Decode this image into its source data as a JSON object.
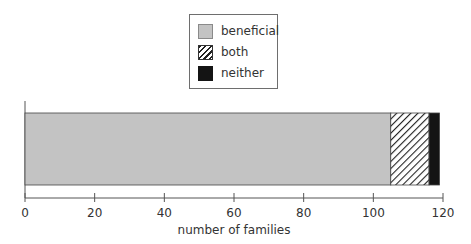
{
  "chart_data": {
    "type": "bar",
    "orientation": "horizontal",
    "stacked": true,
    "categories": [
      ""
    ],
    "series": [
      {
        "name": "beneficial",
        "values": [
          105
        ],
        "color": "#c3c3c3",
        "pattern": "solid"
      },
      {
        "name": "both",
        "values": [
          11
        ],
        "color": "#ffffff",
        "pattern": "diagonal-hatch"
      },
      {
        "name": "neither",
        "values": [
          3
        ],
        "color": "#141414",
        "pattern": "solid"
      }
    ],
    "title": "",
    "xlabel": "number of families",
    "ylabel": "",
    "xlim": [
      0,
      120
    ],
    "xticks": [
      0,
      20,
      40,
      60,
      80,
      100,
      120
    ],
    "grid": false,
    "legend_position": "top-center"
  },
  "legend": {
    "items": [
      {
        "label": "beneficial"
      },
      {
        "label": "both"
      },
      {
        "label": "neither"
      }
    ]
  }
}
